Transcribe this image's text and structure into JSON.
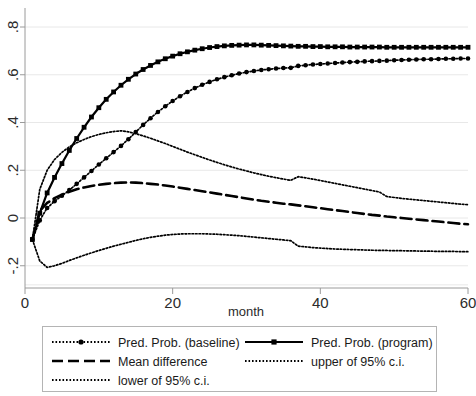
{
  "chart_data": {
    "type": "line",
    "title": "",
    "xlabel": "month",
    "ylabel": "",
    "xlim": [
      0,
      60
    ],
    "ylim": [
      -0.3,
      0.85
    ],
    "xticks": [
      0,
      20,
      40,
      60
    ],
    "xticklabels": [
      "0",
      "20",
      "40",
      "60"
    ],
    "yticks": [
      -0.2,
      0,
      0.2,
      0.4,
      0.6,
      0.8
    ],
    "yticklabels": [
      "-.2",
      "0",
      ".2",
      ".4",
      ".6",
      ".8"
    ],
    "grid": true,
    "grid_axis": "y",
    "legend_position": "below-plot",
    "x": [
      1,
      2,
      3,
      4,
      5,
      6,
      7,
      8,
      9,
      10,
      11,
      12,
      13,
      14,
      15,
      16,
      17,
      18,
      19,
      20,
      21,
      22,
      23,
      24,
      25,
      26,
      27,
      28,
      29,
      30,
      31,
      32,
      33,
      34,
      35,
      36,
      37,
      38,
      39,
      40,
      41,
      42,
      43,
      44,
      45,
      46,
      47,
      48,
      49,
      50,
      51,
      52,
      53,
      54,
      55,
      56,
      57,
      58,
      59,
      60
    ],
    "series": [
      {
        "name": "Pred. Prob. (baseline)",
        "marker": "dot",
        "linestyle": "dotted",
        "color": "#000000",
        "values": [
          -0.09,
          -0.01,
          0.042,
          0.07,
          0.093,
          0.117,
          0.143,
          0.17,
          0.197,
          0.224,
          0.25,
          0.276,
          0.302,
          0.33,
          0.36,
          0.39,
          0.418,
          0.444,
          0.468,
          0.49,
          0.51,
          0.528,
          0.544,
          0.558,
          0.57,
          0.581,
          0.59,
          0.598,
          0.605,
          0.611,
          0.616,
          0.62,
          0.623,
          0.626,
          0.628,
          0.629,
          0.637,
          0.64,
          0.643,
          0.645,
          0.647,
          0.649,
          0.651,
          0.653,
          0.654,
          0.656,
          0.657,
          0.658,
          0.659,
          0.661,
          0.662,
          0.663,
          0.664,
          0.665,
          0.665,
          0.666,
          0.667,
          0.667,
          0.668,
          0.668
        ]
      },
      {
        "name": "Pred. Prob. (program)",
        "marker": "square",
        "linestyle": "solid",
        "color": "#000000",
        "values": [
          -0.09,
          0.02,
          0.105,
          0.17,
          0.228,
          0.283,
          0.333,
          0.38,
          0.423,
          0.462,
          0.497,
          0.528,
          0.556,
          0.581,
          0.603,
          0.622,
          0.639,
          0.654,
          0.667,
          0.678,
          0.688,
          0.696,
          0.703,
          0.709,
          0.714,
          0.718,
          0.721,
          0.723,
          0.724,
          0.725,
          0.725,
          0.724,
          0.723,
          0.722,
          0.721,
          0.72,
          0.719,
          0.719,
          0.718,
          0.718,
          0.717,
          0.717,
          0.717,
          0.716,
          0.716,
          0.716,
          0.716,
          0.716,
          0.715,
          0.715,
          0.715,
          0.715,
          0.715,
          0.715,
          0.715,
          0.715,
          0.715,
          0.715,
          0.715,
          0.715
        ]
      },
      {
        "name": "Mean difference",
        "marker": "none",
        "linestyle": "dashed",
        "color": "#000000",
        "values": [
          -0.09,
          0.03,
          0.063,
          0.083,
          0.098,
          0.11,
          0.12,
          0.128,
          0.134,
          0.139,
          0.143,
          0.146,
          0.148,
          0.149,
          0.148,
          0.146,
          0.143,
          0.14,
          0.136,
          0.132,
          0.127,
          0.122,
          0.117,
          0.112,
          0.107,
          0.102,
          0.097,
          0.092,
          0.087,
          0.082,
          0.077,
          0.072,
          0.068,
          0.064,
          0.06,
          0.057,
          0.053,
          0.049,
          0.045,
          0.041,
          0.037,
          0.033,
          0.029,
          0.025,
          0.021,
          0.017,
          0.013,
          0.01,
          0.006,
          0.003,
          0.0,
          -0.003,
          -0.006,
          -0.009,
          -0.012,
          -0.015,
          -0.018,
          -0.021,
          -0.024,
          -0.026
        ]
      },
      {
        "name": "upper of 95% c.i.",
        "marker": "none",
        "linestyle": "dotted",
        "color": "#000000",
        "values": [
          -0.09,
          0.12,
          0.2,
          0.245,
          0.275,
          0.298,
          0.315,
          0.329,
          0.341,
          0.35,
          0.357,
          0.362,
          0.365,
          0.361,
          0.353,
          0.344,
          0.334,
          0.323,
          0.312,
          0.3,
          0.288,
          0.276,
          0.265,
          0.254,
          0.243,
          0.233,
          0.223,
          0.214,
          0.205,
          0.197,
          0.189,
          0.182,
          0.175,
          0.169,
          0.163,
          0.158,
          0.173,
          0.168,
          0.163,
          0.157,
          0.151,
          0.145,
          0.139,
          0.133,
          0.127,
          0.121,
          0.115,
          0.109,
          0.09,
          0.086,
          0.082,
          0.079,
          0.076,
          0.073,
          0.07,
          0.067,
          0.064,
          0.061,
          0.058,
          0.056
        ]
      },
      {
        "name": "lower of 95% c.i.",
        "marker": "none",
        "linestyle": "dotted",
        "color": "#000000",
        "values": [
          -0.09,
          -0.18,
          -0.207,
          -0.2,
          -0.19,
          -0.178,
          -0.167,
          -0.156,
          -0.146,
          -0.136,
          -0.127,
          -0.118,
          -0.11,
          -0.102,
          -0.094,
          -0.087,
          -0.081,
          -0.076,
          -0.072,
          -0.069,
          -0.067,
          -0.066,
          -0.066,
          -0.066,
          -0.067,
          -0.068,
          -0.07,
          -0.072,
          -0.074,
          -0.077,
          -0.08,
          -0.083,
          -0.086,
          -0.089,
          -0.092,
          -0.095,
          -0.118,
          -0.121,
          -0.124,
          -0.126,
          -0.128,
          -0.13,
          -0.131,
          -0.132,
          -0.133,
          -0.134,
          -0.135,
          -0.136,
          -0.136,
          -0.137,
          -0.137,
          -0.138,
          -0.138,
          -0.139,
          -0.139,
          -0.14,
          -0.14,
          -0.14,
          -0.141,
          -0.141
        ]
      }
    ]
  },
  "legend": {
    "entries": [
      {
        "label": "Pred. Prob. (baseline)",
        "style": "dotted-marker"
      },
      {
        "label": "Pred. Prob. (program)",
        "style": "solid-marker"
      },
      {
        "label": "Mean difference",
        "style": "dashed"
      },
      {
        "label": "upper of 95% c.i.",
        "style": "dotted"
      },
      {
        "label": "lower of 95% c.i.",
        "style": "dotted"
      }
    ]
  }
}
